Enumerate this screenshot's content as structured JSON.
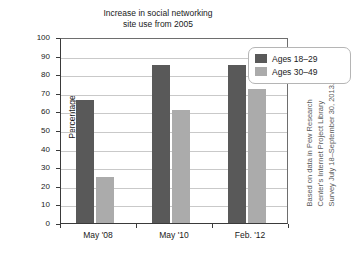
{
  "chart_data": {
    "type": "bar",
    "title": "Increase in social networking\nsite use from 2005",
    "xlabel": "",
    "ylabel": "Percentage",
    "ylim": [
      0,
      100
    ],
    "ytick_step": 10,
    "yticks": [
      "100",
      "90",
      "80",
      "70",
      "60",
      "50",
      "40",
      "30",
      "20",
      "10",
      "0"
    ],
    "grid": true,
    "legend_position": "top-right",
    "categories": [
      "May '08",
      "May '10",
      "Feb. '12"
    ],
    "series": [
      {
        "name": "Ages 18–29",
        "color": "#595959",
        "values": [
          66,
          85,
          85
        ]
      },
      {
        "name": "Ages 30–49",
        "color": "#ababab",
        "values": [
          25,
          61,
          72
        ]
      }
    ],
    "source_note": "Based on data in Pew Research\nCenter's Internet Project Library\nSurvey July 18–September 30, 2013."
  },
  "legend": {
    "entries": [
      {
        "label": "Ages 18–29",
        "swatch": "dark"
      },
      {
        "label": "Ages 30–49",
        "swatch": "light"
      }
    ]
  },
  "colors": {
    "series_dark": "#595959",
    "series_light": "#ababab",
    "gridline": "#c9c9c9",
    "axis": "#3a3a3a",
    "background": "#ffffff"
  }
}
